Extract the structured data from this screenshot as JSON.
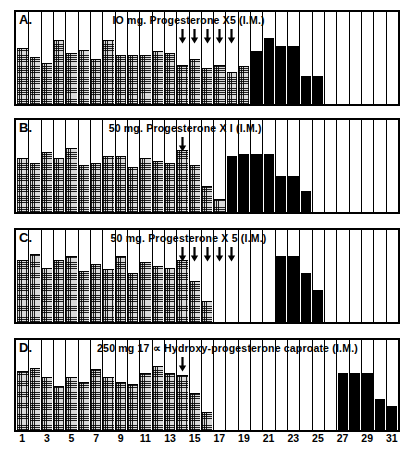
{
  "figure": {
    "axis": {
      "day_min": 1,
      "day_max": 31,
      "tick_labels": [
        "1",
        "3",
        "5",
        "7",
        "9",
        "11",
        "13",
        "15",
        "17",
        "19",
        "21",
        "23",
        "25",
        "27",
        "29",
        "31"
      ],
      "tick_days": [
        1,
        3,
        5,
        7,
        9,
        11,
        13,
        15,
        17,
        19,
        21,
        23,
        25,
        27,
        29,
        31
      ]
    },
    "legend": {
      "stipple_label": "stippled-bar",
      "solid_label": "solid-black-bar",
      "arrow_label": "injection-arrow"
    },
    "colors": {
      "ink": "#000000",
      "paper": "#ffffff",
      "stipple_fill": "#d9d9d9",
      "solid_fill": "#000000"
    }
  },
  "chart_data": {
    "type": "bar",
    "xlabel": "",
    "ylabel": "",
    "x": [
      1,
      2,
      3,
      4,
      5,
      6,
      7,
      8,
      9,
      10,
      11,
      12,
      13,
      14,
      15,
      16,
      17,
      18,
      19,
      20,
      21,
      22,
      23,
      24,
      25,
      26,
      27,
      28,
      29,
      30,
      31
    ],
    "ylim": [
      0,
      100
    ],
    "grid": true,
    "legend_position": "none",
    "panels": [
      {
        "id": "A",
        "letter": "A.",
        "title": "IO mg.  Progesterone  X5 (I.M.)",
        "title_left_pct": 25.0,
        "arrows_days": [
          14,
          15,
          16,
          17,
          18
        ],
        "series": [
          {
            "name": "stippled",
            "fill": "stipple",
            "values": [
              60,
              50,
              44,
              68,
              54,
              58,
              48,
              68,
              52,
              52,
              52,
              56,
              54,
              42,
              48,
              38,
              42,
              34,
              40,
              0,
              0,
              0,
              0,
              0,
              0,
              0,
              0,
              0,
              0,
              0,
              0
            ]
          },
          {
            "name": "solid",
            "fill": "solid",
            "values": [
              0,
              0,
              0,
              0,
              0,
              0,
              0,
              0,
              0,
              0,
              0,
              0,
              0,
              0,
              0,
              0,
              0,
              0,
              0,
              56,
              70,
              62,
              62,
              30,
              30,
              0,
              0,
              0,
              0,
              0,
              0
            ]
          }
        ]
      },
      {
        "id": "B",
        "letter": "B.",
        "title": "50 mg.  Progesterone  X I  (I.M.)",
        "title_left_pct": 24.0,
        "arrows_days": [
          14
        ],
        "series": [
          {
            "name": "stippled",
            "fill": "stipple",
            "values": [
              58,
              52,
              64,
              58,
              68,
              50,
              52,
              60,
              60,
              48,
              58,
              54,
              52,
              66,
              50,
              28,
              14,
              0,
              0,
              0,
              0,
              0,
              0,
              0,
              0,
              0,
              0,
              0,
              0,
              0,
              0
            ]
          },
          {
            "name": "solid",
            "fill": "solid",
            "values": [
              0,
              0,
              0,
              0,
              0,
              0,
              0,
              0,
              0,
              0,
              0,
              0,
              0,
              0,
              0,
              0,
              0,
              60,
              62,
              62,
              62,
              38,
              38,
              22,
              0,
              0,
              0,
              0,
              0,
              0,
              0
            ]
          }
        ]
      },
      {
        "id": "C",
        "letter": "C.",
        "title": "50 mg.  Progesterone  X 5 (I.M.)",
        "title_left_pct": 24.5,
        "arrows_days": [
          14,
          15,
          16,
          17,
          18
        ],
        "series": [
          {
            "name": "stippled",
            "fill": "stipple",
            "values": [
              66,
              72,
              58,
              66,
              70,
              54,
              62,
              56,
              70,
              52,
              64,
              60,
              58,
              66,
              44,
              22,
              0,
              0,
              0,
              0,
              0,
              0,
              0,
              0,
              0,
              0,
              0,
              0,
              0,
              0,
              0
            ]
          },
          {
            "name": "solid",
            "fill": "solid",
            "values": [
              0,
              0,
              0,
              0,
              0,
              0,
              0,
              0,
              0,
              0,
              0,
              0,
              0,
              0,
              0,
              0,
              0,
              0,
              0,
              0,
              0,
              70,
              70,
              52,
              34,
              0,
              0,
              0,
              0,
              0,
              0
            ]
          }
        ]
      },
      {
        "id": "D",
        "letter": "D.",
        "title": "250 mg  17 ∝ Hydroxy-progesterone  caproate  (I.M.)",
        "title_left_pct": 21.0,
        "arrows_days": [
          14
        ],
        "series": [
          {
            "name": "stippled",
            "fill": "stipple",
            "values": [
              64,
              68,
              58,
              48,
              58,
              52,
              66,
              58,
              52,
              50,
              62,
              70,
              62,
              60,
              40,
              20,
              0,
              0,
              0,
              0,
              0,
              0,
              0,
              0,
              0,
              0,
              0,
              0,
              0,
              0,
              0
            ]
          },
          {
            "name": "solid",
            "fill": "solid",
            "values": [
              0,
              0,
              0,
              0,
              0,
              0,
              0,
              0,
              0,
              0,
              0,
              0,
              0,
              0,
              0,
              0,
              0,
              0,
              0,
              0,
              0,
              0,
              0,
              0,
              0,
              0,
              62,
              62,
              62,
              34,
              26
            ]
          }
        ]
      }
    ]
  }
}
